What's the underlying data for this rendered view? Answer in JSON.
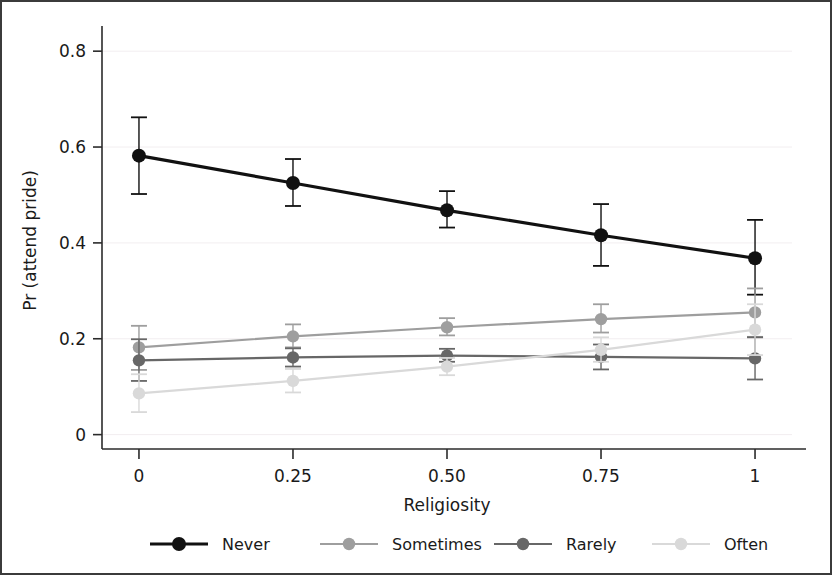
{
  "chart_data": {
    "type": "line",
    "title": "",
    "xlabel": "Religiosity",
    "ylabel": "Pr (attend pride)",
    "x": [
      0,
      0.25,
      0.5,
      0.75,
      1
    ],
    "xtick_labels": [
      "0",
      "0.25",
      "0.50",
      "0.75",
      "1"
    ],
    "ytick_labels": [
      "0",
      "0.2",
      "0.4",
      "0.6",
      "0.8"
    ],
    "ytick_values": [
      0,
      0.2,
      0.4,
      0.6,
      0.8
    ],
    "xlim": [
      -0.06,
      1.06
    ],
    "ylim": [
      -0.03,
      0.84
    ],
    "grid": true,
    "legend_position": "bottom",
    "error_bars": true,
    "series": [
      {
        "name": "Never",
        "color": "#111111",
        "values": [
          0.582,
          0.525,
          0.468,
          0.416,
          0.368
        ],
        "ci_low": [
          0.502,
          0.477,
          0.432,
          0.352,
          0.292
        ],
        "ci_high": [
          0.662,
          0.575,
          0.508,
          0.481,
          0.448
        ]
      },
      {
        "name": "Sometimes",
        "color": "#9e9e9e",
        "values": [
          0.182,
          0.205,
          0.224,
          0.241,
          0.255
        ],
        "ci_low": [
          0.135,
          0.182,
          0.207,
          0.213,
          0.204
        ],
        "ci_high": [
          0.227,
          0.23,
          0.243,
          0.272,
          0.305
        ]
      },
      {
        "name": "Rarely",
        "color": "#676767",
        "values": [
          0.155,
          0.161,
          0.165,
          0.162,
          0.159
        ],
        "ci_low": [
          0.112,
          0.142,
          0.152,
          0.136,
          0.115
        ],
        "ci_high": [
          0.199,
          0.18,
          0.179,
          0.188,
          0.203
        ]
      },
      {
        "name": "Often",
        "color": "#d9d9d9",
        "values": [
          0.086,
          0.112,
          0.142,
          0.177,
          0.219
        ],
        "ci_low": [
          0.047,
          0.088,
          0.124,
          0.152,
          0.166
        ],
        "ci_high": [
          0.126,
          0.137,
          0.16,
          0.203,
          0.272
        ]
      }
    ]
  },
  "legend": {
    "items": [
      {
        "label": "Never",
        "color": "#111111"
      },
      {
        "label": "Sometimes",
        "color": "#9e9e9e"
      },
      {
        "label": "Rarely",
        "color": "#676767"
      },
      {
        "label": "Often",
        "color": "#d9d9d9"
      }
    ]
  },
  "style": {
    "frame_color": "#3b3b3b",
    "axis_color": "#2b2b2b",
    "grid_color": "#f2eef0",
    "background": "#ffffff"
  }
}
